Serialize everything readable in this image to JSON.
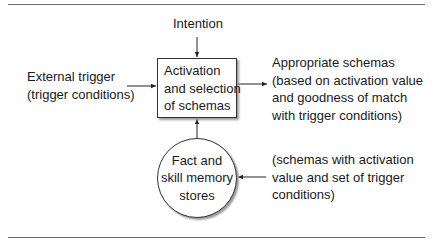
{
  "diagram": {
    "intention": "Intention",
    "external_trigger": {
      "lines": [
        "External trigger",
        "(trigger conditions)"
      ]
    },
    "process_box": {
      "lines": [
        "Activation",
        "and selection",
        "of schemas"
      ]
    },
    "output": {
      "lines": [
        "Appropriate schemas",
        "(based on activation value",
        "and goodness of match",
        "with trigger conditions)"
      ]
    },
    "memory_store": {
      "lines": [
        "Fact and",
        "skill memory",
        "stores"
      ]
    },
    "memory_note": {
      "lines": [
        "(schemas with activation",
        "value and set of trigger",
        "conditions)"
      ]
    },
    "edges": [
      {
        "from": "Intention",
        "to": "Activation and selection of schemas"
      },
      {
        "from": "External trigger (trigger conditions)",
        "to": "Activation and selection of schemas"
      },
      {
        "from": "Activation and selection of schemas",
        "to": "Appropriate schemas"
      },
      {
        "from": "Fact and skill memory stores",
        "to": "Activation and selection of schemas"
      },
      {
        "from": "(schemas with activation value and set of trigger conditions)",
        "to": "Fact and skill memory stores"
      }
    ]
  }
}
